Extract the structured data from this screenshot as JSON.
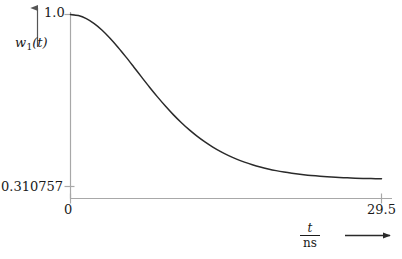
{
  "figure": {
    "background_color": "#ffffff",
    "axis_color": "#a8a8a8",
    "curve_color": "#2a2a2a",
    "text_color": "#1a1a1a"
  },
  "yaxis": {
    "name_var": "w",
    "name_sub": "1",
    "name_arg": "(t)",
    "tick_top": "1.0",
    "tick_bottom": "0.310757"
  },
  "xaxis": {
    "tick_left": "0",
    "tick_right": "29.5",
    "name_numerator": "t",
    "name_denominator": "ns",
    "arrow_icon": "right-arrow-icon"
  },
  "chart_data": {
    "type": "line",
    "title": "",
    "xlabel": "t / ns",
    "ylabel": "w_1(t)",
    "xlim": [
      0,
      29.5
    ],
    "ylim": [
      0.310757,
      1.0
    ],
    "grid": false,
    "legend": null,
    "xticks": [
      0,
      29.5
    ],
    "xticklabels": [
      "0",
      "29.5"
    ],
    "yticks": [
      0.310757,
      1.0
    ],
    "yticklabels": [
      "0.310757",
      "1.0"
    ],
    "asymptote": 0.310757,
    "series": [
      {
        "name": "w_1(t)",
        "color": "#2a2a2a",
        "x": [
          0,
          0.75,
          1.5,
          2.25,
          3,
          3.75,
          4.5,
          5.25,
          6,
          6.75,
          7.5,
          8.25,
          9,
          9.75,
          10.5,
          11.25,
          12,
          12.75,
          13.5,
          14.25,
          15,
          15.75,
          16.5,
          17.25,
          18,
          18.75,
          19.5,
          20.25,
          21,
          21.75,
          22.5,
          23.25,
          24,
          24.75,
          25.5,
          26.25,
          27,
          27.75,
          28.5,
          29.5
        ],
        "y": [
          1.0,
          0.9957,
          0.9832,
          0.9632,
          0.9368,
          0.9049,
          0.8689,
          0.8301,
          0.7897,
          0.7489,
          0.7087,
          0.6699,
          0.6331,
          0.5988,
          0.5672,
          0.5384,
          0.5125,
          0.4893,
          0.4687,
          0.4505,
          0.4345,
          0.4205,
          0.4084,
          0.3979,
          0.3888,
          0.3811,
          0.3744,
          0.3687,
          0.3639,
          0.3598,
          0.3563,
          0.3534,
          0.3509,
          0.3488,
          0.3471,
          0.3456,
          0.3443,
          0.3433,
          0.3424,
          0.3415
        ]
      }
    ]
  }
}
